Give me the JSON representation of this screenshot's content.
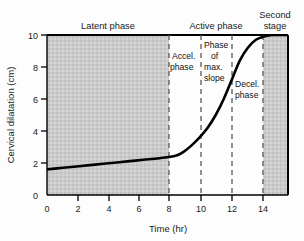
{
  "chart_data": {
    "type": "line",
    "title": "",
    "xlabel": "Time (hr)",
    "ylabel": "Cervical dilatation (cm)",
    "xlim": [
      0,
      15
    ],
    "ylim": [
      0,
      10
    ],
    "grid": false,
    "legend": "none",
    "xticks": [
      "0",
      "2",
      "4",
      "6",
      "8",
      "10",
      "12",
      "14"
    ],
    "xtick_values": [
      0,
      2,
      4,
      6,
      8,
      10,
      12,
      14
    ],
    "yticks": [
      "0",
      "2",
      "4",
      "6",
      "8",
      "10"
    ],
    "ytick_values": [
      0,
      2,
      4,
      6,
      8,
      10
    ],
    "series": [
      {
        "name": "Friedman labor curve",
        "x": [
          0,
          1,
          2,
          3,
          4,
          5,
          6,
          7,
          8,
          8.5,
          9,
          9.5,
          10,
          10.5,
          11,
          11.5,
          12,
          12.5,
          13,
          13.5,
          14,
          15
        ],
        "values": [
          1.6,
          1.7,
          1.8,
          1.9,
          2.0,
          2.1,
          2.2,
          2.3,
          2.45,
          2.7,
          3.1,
          3.6,
          4.2,
          5.0,
          6.0,
          7.2,
          8.4,
          9.2,
          9.7,
          9.9,
          10.0,
          10.0
        ]
      }
    ],
    "shaded_regions": [
      {
        "label": "Latent phase",
        "x_start": 0,
        "x_end": 8
      },
      {
        "label": "Second stage",
        "x_start": 14,
        "x_end": 15
      }
    ],
    "dashed_verticals": [
      8,
      10,
      12,
      14
    ],
    "annotations": [
      {
        "text": "Latent phase",
        "x": 4,
        "position": "above-axis"
      },
      {
        "text": "Active phase",
        "x": 11,
        "position": "above-axis"
      },
      {
        "text": "Second stage",
        "x": 14.6,
        "position": "above-axis"
      },
      {
        "text": "Accel. phase",
        "x": 9,
        "position": "inside"
      },
      {
        "text": "Phase of max. slope",
        "x": 11,
        "position": "inside"
      },
      {
        "text": "Decel. phase",
        "x": 13,
        "position": "inside"
      }
    ],
    "colors": {
      "curve": "#000000",
      "shading": "#c9c9c9",
      "axis": "#000000",
      "dashed": "#595959"
    }
  },
  "axes": {
    "x_label": "Time (hr)",
    "y_label": "Cervical dilatation (cm)",
    "x_ticks": [
      "0",
      "2",
      "4",
      "6",
      "8",
      "10",
      "12",
      "14"
    ],
    "y_ticks": [
      "10",
      "8",
      "6",
      "4",
      "2",
      "0"
    ]
  },
  "top_labels": {
    "latent": "Latent phase",
    "active": "Active phase",
    "second_line1": "Second",
    "second_line2": "stage"
  },
  "inner_labels": {
    "accel_line1": "Accel.",
    "accel_line2": "phase",
    "maxslope_line1": "Phase",
    "maxslope_line2": "of",
    "maxslope_line3": "max.",
    "maxslope_line4": "slope",
    "decel_line1": "Decel.",
    "decel_line2": "phase"
  }
}
